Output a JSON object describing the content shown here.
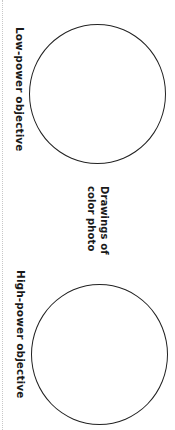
{
  "worksheet": {
    "low_power": {
      "label": "Low-power objective",
      "drawing_area": "empty-circle"
    },
    "center_caption": {
      "line1": "Drawings of",
      "line2": "color photo"
    },
    "high_power": {
      "label": "High-power objective",
      "drawing_area": "empty-circle"
    },
    "colors": {
      "ink": "#222222",
      "background": "#ffffff",
      "edge_dots": "#c8c8c8"
    }
  }
}
